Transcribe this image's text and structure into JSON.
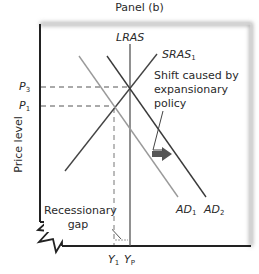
{
  "title": "Panel (b)",
  "axes": {
    "y_label": "Price level",
    "x_ticks": [
      {
        "main": "Y",
        "sub": "1"
      },
      {
        "main": "Y",
        "sub": "P"
      }
    ],
    "y_ticks": [
      {
        "main": "P",
        "sub": "3"
      },
      {
        "main": "P",
        "sub": "1"
      }
    ]
  },
  "curves": {
    "lras": {
      "main": "LRAS",
      "sub": ""
    },
    "sras": {
      "main": "SRAS",
      "sub": "1"
    },
    "ad1": {
      "main": "AD",
      "sub": "1"
    },
    "ad2": {
      "main": "AD",
      "sub": "2"
    }
  },
  "annotations": {
    "shift_line1": "Shift caused by",
    "shift_line2": "expansionary",
    "shift_line3": "policy",
    "gap_line1": "Recessionary",
    "gap_line2": "gap"
  },
  "colors": {
    "axis": "#222222",
    "ad1": "#9a9a9a",
    "ad2": "#3a3a3a",
    "sras": "#444444",
    "lras": "#555555",
    "arrow": "#555555",
    "dash": "#555555"
  }
}
